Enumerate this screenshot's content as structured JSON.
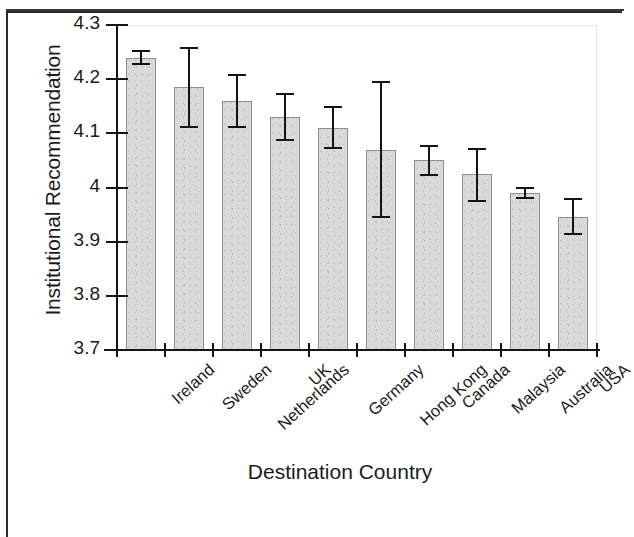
{
  "chart_data": {
    "type": "bar",
    "title": "",
    "xlabel": "Destination Country",
    "ylabel": "Institutional Recommendation",
    "categories": [
      "Ireland",
      "Sweden",
      "Netherlands",
      "UK",
      "Germany",
      "Hong Kong",
      "Canada",
      "Malaysia",
      "Australia",
      "USA"
    ],
    "values": [
      4.24,
      4.185,
      4.16,
      4.13,
      4.11,
      4.07,
      4.05,
      4.025,
      3.99,
      3.945
    ],
    "error_low": [
      4.228,
      4.112,
      4.112,
      4.087,
      4.073,
      3.945,
      4.023,
      3.975,
      3.98,
      3.915
    ],
    "error_high": [
      4.252,
      4.257,
      4.208,
      4.173,
      4.148,
      4.195,
      4.077,
      4.072,
      4.0,
      3.978
    ],
    "ylim": [
      3.7,
      4.3
    ],
    "yticks": [
      "4.3",
      "4.2",
      "4.1",
      "4",
      "3.9",
      "3.8",
      "3.7"
    ],
    "ytick_values": [
      4.3,
      4.2,
      4.1,
      4.0,
      3.9,
      3.8,
      3.7
    ],
    "grid": false,
    "legend": "none",
    "bar_color": "#dadada",
    "bar_edge_color": "#8e8e8e",
    "error_color": "#141414",
    "axis_color": "#151515"
  }
}
